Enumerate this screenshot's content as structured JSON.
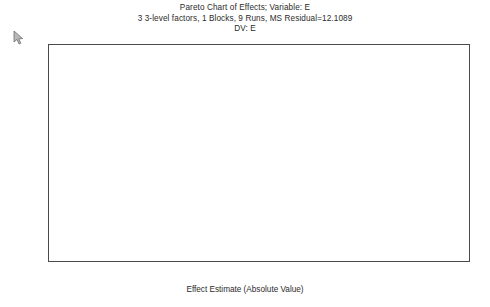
{
  "chart_data": {
    "type": "bar",
    "orientation": "horizontal",
    "title": "Pareto Chart of Effects; Variable: E",
    "subtitle": "3 3-level factors, 1 Blocks, 9 Runs, MS Residual=12.1089",
    "subtitle2": "DV: E",
    "xlabel": "Effect Estimate (Absolute Value)",
    "ylabel": "",
    "xlim": [
      1,
      12
    ],
    "xticks": [
      1,
      2,
      3,
      4,
      5,
      6,
      7,
      8,
      9,
      10,
      11,
      12
    ],
    "grid": false,
    "legend": false,
    "categories": [
      "B(Q)",
      "(2)B(L)",
      "(3)C(L)",
      "C(Q)",
      "(1)A(L)",
      "A(Q)"
    ],
    "values": [
      10.98,
      9.106667,
      4.033333,
      2.6,
      2.536667,
      2.49
    ],
    "labels": [
      "-10.98",
      "9.106667",
      "4.033333",
      "-2.6",
      "2.536667",
      "-2.49"
    ],
    "bars": [
      {
        "category": "B(Q)",
        "value": 10.98,
        "label": "-10.98"
      },
      {
        "category": "(2)B(L)",
        "value": 9.106667,
        "label": "9.106667"
      },
      {
        "category": "(3)C(L)",
        "value": 4.033333,
        "label": "4.033333"
      },
      {
        "category": "C(Q)",
        "value": 2.6,
        "label": "-2.6"
      },
      {
        "category": "(1)A(L)",
        "value": 2.536667,
        "label": "2.536667"
      },
      {
        "category": "A(Q)",
        "value": 2.49,
        "label": "-2.49"
      }
    ],
    "colors": {
      "bar_fill": "#e9e9e9",
      "bar_border": "#555555",
      "axis": "#4a4a4a",
      "text": "#1a1a1a",
      "background": "#ffffff"
    }
  },
  "cursor": {
    "icon": "arrow-cursor-icon"
  }
}
